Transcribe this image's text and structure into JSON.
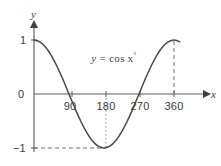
{
  "figure": {
    "title": "",
    "background_color": "#ffffff",
    "curve_color": "#4a4a4a",
    "axis_color": "#5a5a5a",
    "guide_color": "#6e6e6e",
    "text_color": "#3b3b3b"
  },
  "axes": {
    "y_axis_label": "y",
    "x_axis_label": "x",
    "y_tick_labels": [
      "1",
      "0",
      "−1"
    ],
    "x_tick_labels": [
      "90",
      "180",
      "270",
      "360"
    ]
  },
  "annotations": {
    "equation_lhs": "y",
    "equation_eq": "=",
    "equation_rhs": "cos x",
    "equation_degree": "°",
    "equation_full": "y = cos x°"
  },
  "chart_data": {
    "type": "line",
    "title": "",
    "xlabel": "x",
    "ylabel": "y",
    "xlim": [
      -10,
      378
    ],
    "ylim": [
      -1.25,
      1.25
    ],
    "grid": false,
    "legend": false,
    "series": [
      {
        "name": "y = cos x°",
        "x": [
          0,
          15,
          30,
          45,
          60,
          75,
          90,
          105,
          120,
          135,
          150,
          165,
          180,
          195,
          210,
          225,
          240,
          255,
          270,
          285,
          300,
          315,
          330,
          345,
          360,
          375
        ],
        "y": [
          1,
          0.966,
          0.866,
          0.707,
          0.5,
          0.259,
          0,
          -0.259,
          -0.5,
          -0.707,
          -0.866,
          -0.966,
          -1,
          -0.966,
          -0.866,
          -0.707,
          -0.5,
          -0.259,
          0,
          0.259,
          0.5,
          0.707,
          0.866,
          0.966,
          1,
          0.966
        ]
      }
    ],
    "x_ticks": [
      90,
      180,
      270,
      360
    ],
    "y_ticks": [
      1,
      0,
      -1
    ],
    "guides": [
      {
        "kind": "horizontal-dashed",
        "y": -1,
        "from_x": 0,
        "to_x": 180
      },
      {
        "kind": "vertical-dotted",
        "x": 180,
        "from_y": -1,
        "to_y": 0
      },
      {
        "kind": "vertical-dashed",
        "x": 360,
        "from_y": 0,
        "to_y": 1
      }
    ]
  }
}
